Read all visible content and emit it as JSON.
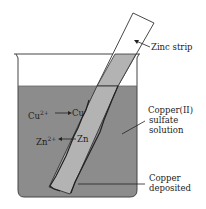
{
  "diagram": {
    "labels": {
      "zinc_strip": "Zinc strip",
      "solution_line1": "Copper(II)",
      "solution_line2": "sulfate",
      "solution_line3": "solution",
      "deposit_line1": "Copper",
      "deposit_line2": "deposited",
      "reaction1_left": "Cu",
      "reaction1_sup": "2+",
      "reaction1_right": "Cu",
      "reaction2_left": "Zn",
      "reaction2_sup": "2+",
      "reaction2_right": "Zn"
    },
    "colors": {
      "solution": "#8c8c8c",
      "strip_submerged": "#b3b3b3",
      "outline": "#333333"
    }
  }
}
